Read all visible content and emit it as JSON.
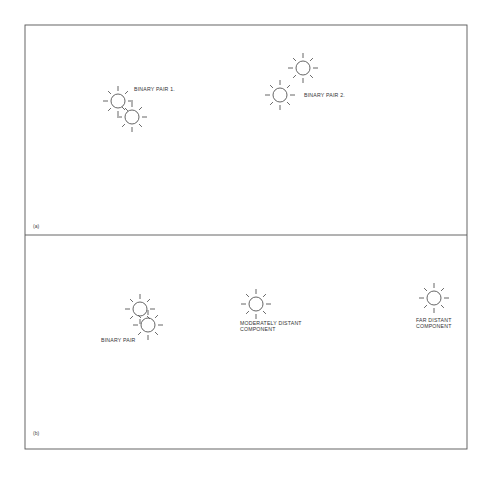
{
  "figure": {
    "panels": [
      {
        "tag": "(a)",
        "stars": [
          {
            "cx": 118,
            "cy": 101
          },
          {
            "cx": 132,
            "cy": 117
          },
          {
            "cx": 303,
            "cy": 68
          },
          {
            "cx": 280,
            "cy": 95
          }
        ],
        "labels": [
          {
            "text": "BINARY PAIR 1.",
            "x": 134,
            "y": 91
          },
          {
            "text": "BINARY PAIR 2.",
            "x": 304,
            "y": 97
          }
        ]
      },
      {
        "tag": "(b)",
        "stars": [
          {
            "cx": 140,
            "cy": 309
          },
          {
            "cx": 148,
            "cy": 325
          },
          {
            "cx": 256,
            "cy": 304
          },
          {
            "cx": 434,
            "cy": 298
          }
        ],
        "labels": [
          {
            "text": "BINARY PAIR",
            "x": 101,
            "y": 342
          },
          {
            "text": "MODERATELY DISTANT",
            "x": 240,
            "y": 325
          },
          {
            "text": "COMPONENT",
            "x": 240,
            "y": 331
          },
          {
            "text": "FAR DISTANT",
            "x": 416,
            "y": 322
          },
          {
            "text": "COMPONENT",
            "x": 416,
            "y": 328
          }
        ]
      }
    ],
    "colors": {
      "line": "#555555",
      "background": "#ffffff"
    }
  }
}
